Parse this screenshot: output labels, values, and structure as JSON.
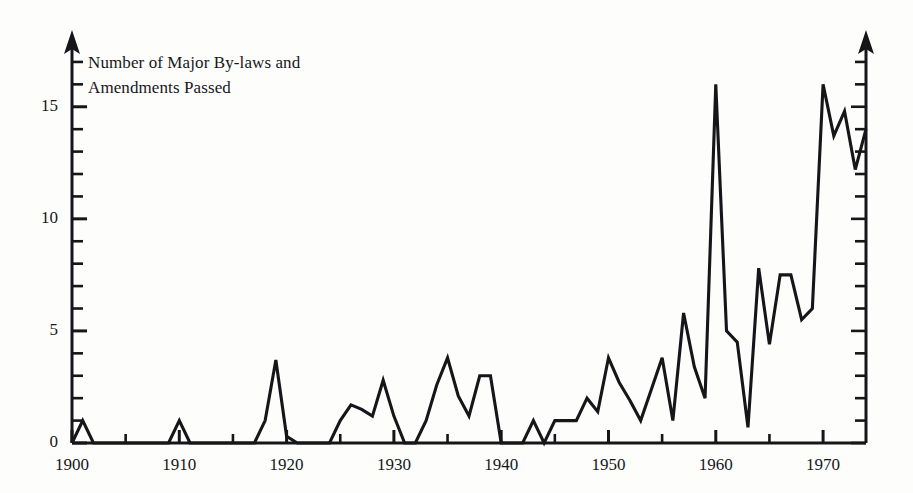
{
  "chart_data": {
    "type": "line",
    "title_line1": "Number of Major By-laws and",
    "title_line2": "Amendments Passed",
    "xlabel": "",
    "ylabel": "Number of Major By-laws and Amendments Passed",
    "xlim": [
      1900,
      1974
    ],
    "ylim": [
      0,
      17.8
    ],
    "grid": false,
    "legend": null,
    "line_color": "#16161a",
    "x_tick_labels": [
      "1900",
      "1910",
      "1920",
      "1930",
      "1940",
      "1950",
      "1960",
      "1970"
    ],
    "x_tick_values": [
      1900,
      1910,
      1920,
      1930,
      1940,
      1950,
      1960,
      1970
    ],
    "x_minor_tick_step": 5,
    "y_tick_labels": [
      "0",
      "5",
      "10",
      "15"
    ],
    "y_tick_values": [
      0,
      5,
      10,
      15
    ],
    "y_minor_tick_step": 1,
    "x": [
      1900,
      1901,
      1902,
      1903,
      1904,
      1905,
      1906,
      1907,
      1908,
      1909,
      1910,
      1911,
      1912,
      1913,
      1914,
      1915,
      1916,
      1917,
      1918,
      1919,
      1920,
      1921,
      1922,
      1923,
      1924,
      1925,
      1926,
      1927,
      1928,
      1929,
      1930,
      1931,
      1932,
      1933,
      1934,
      1935,
      1936,
      1937,
      1938,
      1939,
      1940,
      1941,
      1942,
      1943,
      1944,
      1945,
      1946,
      1947,
      1948,
      1949,
      1950,
      1951,
      1952,
      1953,
      1954,
      1955,
      1956,
      1957,
      1958,
      1959,
      1960,
      1961,
      1962,
      1963,
      1964,
      1965,
      1966,
      1967,
      1968,
      1969,
      1970,
      1971,
      1972,
      1973,
      1974
    ],
    "values": [
      0,
      1,
      0,
      0,
      0,
      0,
      0,
      0,
      0,
      0,
      1,
      0,
      0,
      0,
      0,
      0,
      0,
      0,
      1,
      3.7,
      0.3,
      0,
      0,
      0,
      0,
      1,
      1.7,
      1.5,
      1.2,
      2.8,
      1.2,
      0,
      0,
      1,
      2.6,
      3.8,
      2.1,
      1.2,
      3,
      3,
      0,
      0,
      0,
      1,
      0,
      1,
      1,
      1,
      2,
      1.4,
      3.8,
      2.7,
      1.9,
      1,
      2.4,
      3.8,
      1,
      5.8,
      3.4,
      2,
      16,
      5,
      4.5,
      0.7,
      7.8,
      4.4,
      7.5,
      7.5,
      5.5,
      6,
      16,
      13.7,
      14.8,
      12.2,
      14
    ],
    "series_name": "Major by-laws and amendments passed"
  },
  "axes": {
    "left_axis_name": "vertical-value-axis",
    "right_axis_name": "right-vertical-axis",
    "bottom_axis_name": "horizontal-year-axis",
    "arrow_heads": true
  }
}
